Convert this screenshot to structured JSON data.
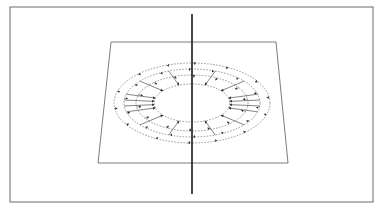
{
  "diagram": {
    "kind": "field around straight current-carrying wire",
    "colors": {
      "background": "#ffffff",
      "frame": "#6a6a6a",
      "plane": "#5a5a5a",
      "wire": "#1a1a1a",
      "field_lines": "#707070",
      "arrows": "#333333"
    },
    "frame": {
      "x": 10,
      "y": 7,
      "width": 363,
      "height": 195
    },
    "plane": {
      "points": [
        [
          111,
          42
        ],
        [
          276,
          42
        ],
        [
          288,
          163
        ],
        [
          98,
          163
        ]
      ]
    },
    "wire": {
      "x": 192,
      "y1": 14,
      "y2": 194
    },
    "field_center": {
      "cx": 192,
      "cy": 103
    },
    "rings": [
      {
        "rx": 38,
        "ry": 19
      },
      {
        "rx": 56,
        "ry": 28
      },
      {
        "rx": 68,
        "ry": 34
      },
      {
        "rx": 78,
        "ry": 40
      }
    ],
    "arrow_direction": "inward",
    "radial_lines": {
      "from_ring": 2,
      "to_ring": 0,
      "angles_deg": [
        15,
        40,
        70,
        110,
        140,
        165,
        195,
        220,
        250,
        290,
        320,
        345,
        5,
        175,
        185,
        355
      ]
    },
    "ring_arrowheads": {
      "angles_deg": [
        0,
        25,
        55,
        80,
        100,
        125,
        155,
        180,
        205,
        235,
        260,
        280,
        305,
        335
      ]
    }
  }
}
